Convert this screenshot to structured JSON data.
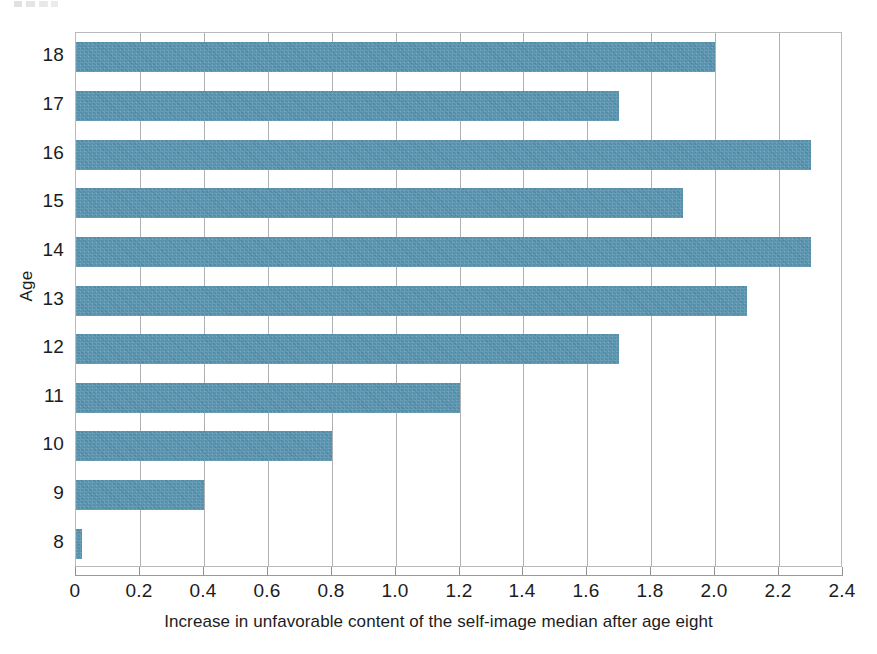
{
  "chart_data": {
    "type": "bar",
    "orientation": "horizontal",
    "title": "",
    "xlabel": "Increase in unfavorable content of the self-image median after age eight",
    "ylabel": "Age",
    "categories": [
      "18",
      "17",
      "16",
      "15",
      "14",
      "13",
      "12",
      "11",
      "10",
      "9",
      "8"
    ],
    "values": [
      2.0,
      1.7,
      2.3,
      1.9,
      2.3,
      2.1,
      1.7,
      1.2,
      0.8,
      0.4,
      0.02
    ],
    "xlim": [
      0,
      2.4
    ],
    "xticks": [
      0,
      0.2,
      0.4,
      0.6,
      0.8,
      1.0,
      1.2,
      1.4,
      1.6,
      1.8,
      2.0,
      2.2,
      2.4
    ],
    "xtick_labels": [
      "0",
      "0.2",
      "0.4",
      "0.6",
      "0.8",
      "1.0",
      "1.2",
      "1.4",
      "1.6",
      "1.8",
      "2.0",
      "2.2",
      "2.4"
    ],
    "grid": "vertical",
    "legend": null,
    "series": [
      {
        "name": "Increase in unfavorable content of the self-image median after age eight",
        "color": "#5390ad",
        "values": [
          2.0,
          1.7,
          2.3,
          1.9,
          2.3,
          2.1,
          1.7,
          1.2,
          0.8,
          0.4,
          0.02
        ]
      }
    ],
    "points": [
      {
        "age": "18",
        "value": 2.0
      },
      {
        "age": "17",
        "value": 1.7
      },
      {
        "age": "16",
        "value": 2.3
      },
      {
        "age": "15",
        "value": 1.9
      },
      {
        "age": "14",
        "value": 2.3
      },
      {
        "age": "13",
        "value": 2.1
      },
      {
        "age": "12",
        "value": 1.7
      },
      {
        "age": "11",
        "value": 1.2
      },
      {
        "age": "10",
        "value": 0.8
      },
      {
        "age": "9",
        "value": 0.4
      },
      {
        "age": "8",
        "value": 0.02
      }
    ]
  },
  "colors": {
    "bar": "#5390ad",
    "gridline": "#b0b1b4",
    "frame": "#b9babc",
    "text": "#1c1c1c",
    "background": "#ffffff"
  }
}
